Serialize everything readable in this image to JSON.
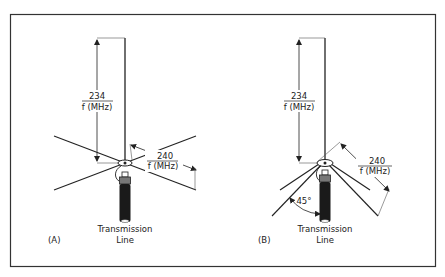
{
  "figure": {
    "panels": [
      {
        "id": "A",
        "label": "(A)",
        "vertical_length": {
          "numerator": "234",
          "denominator": "f (MHz)"
        },
        "radial_length": {
          "numerator": "240",
          "denominator": "f (MHz)"
        },
        "feed_label_line1": "Transmission",
        "feed_label_line2": "Line"
      },
      {
        "id": "B",
        "label": "(B)",
        "vertical_length": {
          "numerator": "234",
          "denominator": "f (MHz)"
        },
        "radial_length": {
          "numerator": "240",
          "denominator": "f (MHz)"
        },
        "droop_angle": "45°",
        "feed_label_line1": "Transmission",
        "feed_label_line2": "Line"
      }
    ]
  }
}
